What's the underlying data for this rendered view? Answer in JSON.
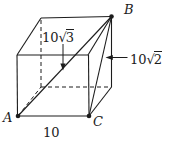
{
  "diagram": {
    "type": "cube-with-diagonals",
    "background_color": "#ffffff",
    "line_color": "#1c1c1c",
    "vertex_labels": {
      "A": "A",
      "B": "B",
      "C": "C"
    },
    "edge_label_ac": "10",
    "space_diagonal_ab_label": {
      "coefficient": "10",
      "radical_sign": "√",
      "radicand": "3"
    },
    "face_diagonal_bc_label": {
      "coefficient": "10",
      "radical_sign": "√",
      "radicand": "2"
    }
  }
}
